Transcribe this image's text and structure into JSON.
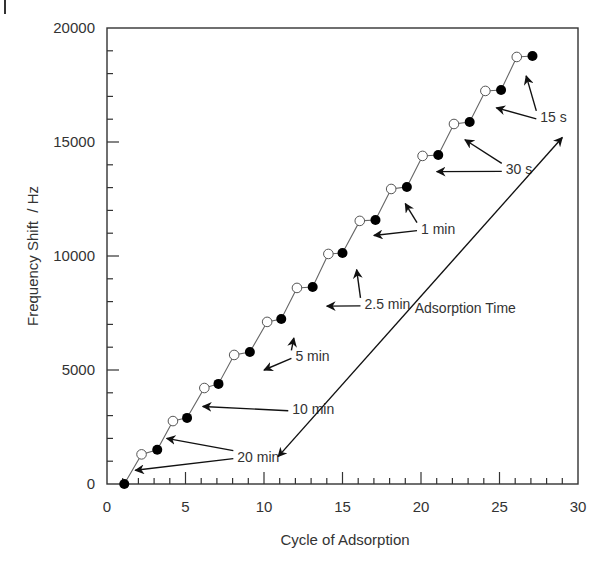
{
  "chart_data": {
    "type": "line",
    "title": "",
    "xlabel": "Cycle of Adsorption",
    "ylabel": "Frequency Shift  / Hz",
    "xlim": [
      0,
      30
    ],
    "ylim": [
      0,
      20000
    ],
    "x_ticks": [
      0,
      5,
      10,
      15,
      20,
      25,
      30
    ],
    "y_ticks": [
      0,
      5000,
      10000,
      15000,
      20000
    ],
    "x_minor_step": 1,
    "y_minor_step": 1000,
    "grid": false,
    "legend": null,
    "series": [
      {
        "name": "Frequency shift (connected)",
        "style": "line",
        "x": [
          1.1,
          2.2,
          3.2,
          4.2,
          5.1,
          6.2,
          7.1,
          8.1,
          9.1,
          10.2,
          11.1,
          12.1,
          13.1,
          14.1,
          15.0,
          16.1,
          17.1,
          18.1,
          19.1,
          20.1,
          21.1,
          22.1,
          23.1,
          24.1,
          25.1,
          26.1,
          27.1
        ],
        "y": [
          0,
          1300,
          1500,
          2760,
          2900,
          4210,
          4390,
          5660,
          5790,
          7110,
          7240,
          8600,
          8640,
          10090,
          10130,
          11540,
          11580,
          12940,
          13030,
          14390,
          14430,
          15790,
          15880,
          17240,
          17280,
          18730,
          18770
        ]
      },
      {
        "name": "Open markers",
        "marker": "open-circle",
        "x": [
          2.2,
          4.2,
          6.2,
          8.1,
          10.2,
          12.1,
          14.1,
          16.1,
          18.1,
          20.1,
          22.1,
          24.1,
          26.1
        ],
        "y": [
          1300,
          2760,
          4210,
          5660,
          7110,
          8600,
          10090,
          11540,
          12940,
          14390,
          15790,
          17240,
          18730
        ]
      },
      {
        "name": "Filled markers",
        "marker": "filled-circle",
        "x": [
          1.1,
          3.2,
          5.1,
          7.1,
          9.1,
          11.1,
          13.1,
          15.0,
          17.1,
          19.1,
          21.1,
          23.1,
          25.1,
          27.1
        ],
        "y": [
          0,
          1500,
          2900,
          4390,
          5790,
          7240,
          8640,
          10130,
          11580,
          13030,
          14430,
          15880,
          17280,
          18770
        ]
      }
    ],
    "annotations": [
      {
        "text": "20 min",
        "x": 8.3,
        "y": 1200,
        "arrows_to": [
          [
            1.8,
            600
          ],
          [
            3.8,
            2000
          ]
        ]
      },
      {
        "text": "10 min",
        "x": 11.8,
        "y": 3300,
        "arrows_to": [
          [
            6.1,
            3400
          ]
        ]
      },
      {
        "text": "5 min",
        "x": 12.0,
        "y": 5600,
        "arrows_to": [
          [
            10.0,
            5000
          ],
          [
            11.9,
            6400
          ]
        ]
      },
      {
        "text": "2.5 min",
        "x": 16.4,
        "y": 7900,
        "arrows_to": [
          [
            14.0,
            7800
          ],
          [
            15.9,
            9400
          ]
        ]
      },
      {
        "text": "1 min",
        "x": 20.0,
        "y": 11200,
        "arrows_to": [
          [
            17.0,
            10900
          ],
          [
            19.0,
            12300
          ]
        ]
      },
      {
        "text": "30 s",
        "x": 25.4,
        "y": 13800,
        "arrows_to": [
          [
            21.0,
            13700
          ],
          [
            22.8,
            15100
          ]
        ]
      },
      {
        "text": "15 s",
        "x": 27.6,
        "y": 16100,
        "arrows_to": [
          [
            24.8,
            16500
          ],
          [
            26.7,
            17900
          ]
        ]
      },
      {
        "text": "Adsorption Time",
        "x": 19.6,
        "y": 7500,
        "double_arrow": [
          [
            10.9,
            1200
          ],
          [
            29.0,
            15200
          ]
        ]
      }
    ],
    "colors": {
      "line": "#666666",
      "marker": "#000000",
      "axis": "#333333",
      "text": "#333333"
    }
  }
}
